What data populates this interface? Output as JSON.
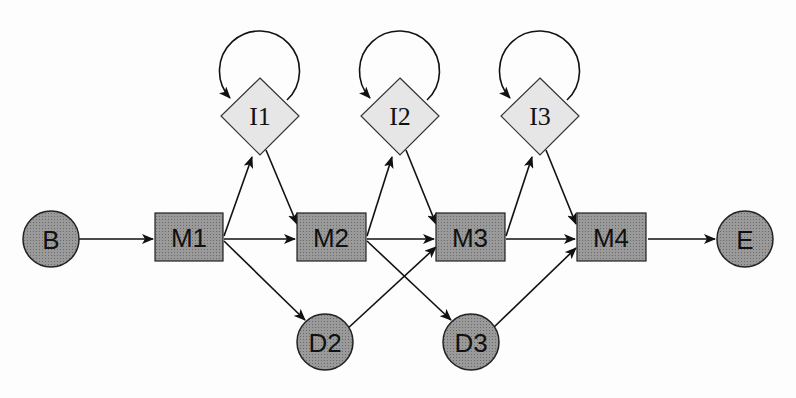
{
  "diagram": {
    "colors": {
      "match_fill": "#8a8a8a",
      "insert_fill": "#e6e6e6",
      "stroke": "#222222",
      "background": "#fdfdfd"
    },
    "nodes": {
      "begin": {
        "label": "B",
        "shape": "circle"
      },
      "m1": {
        "label": "M1",
        "shape": "square"
      },
      "m2": {
        "label": "M2",
        "shape": "square"
      },
      "m3": {
        "label": "M3",
        "shape": "square"
      },
      "m4": {
        "label": "M4",
        "shape": "square"
      },
      "end": {
        "label": "E",
        "shape": "circle"
      },
      "i1": {
        "label": "I1",
        "shape": "diamond"
      },
      "i2": {
        "label": "I2",
        "shape": "diamond"
      },
      "i3": {
        "label": "I3",
        "shape": "diamond"
      },
      "d2": {
        "label": "D2",
        "shape": "circle"
      },
      "d3": {
        "label": "D3",
        "shape": "circle"
      }
    },
    "edges": [
      [
        "B",
        "M1"
      ],
      [
        "M1",
        "M2"
      ],
      [
        "M1",
        "I1"
      ],
      [
        "M1",
        "D2"
      ],
      [
        "I1",
        "I1"
      ],
      [
        "I1",
        "M2"
      ],
      [
        "M2",
        "M3"
      ],
      [
        "M2",
        "I2"
      ],
      [
        "M2",
        "D3"
      ],
      [
        "I2",
        "I2"
      ],
      [
        "I2",
        "M3"
      ],
      [
        "D2",
        "M3"
      ],
      [
        "M3",
        "M4"
      ],
      [
        "M3",
        "I3"
      ],
      [
        "I3",
        "I3"
      ],
      [
        "I3",
        "M4"
      ],
      [
        "D3",
        "M4"
      ],
      [
        "M4",
        "E"
      ]
    ]
  }
}
